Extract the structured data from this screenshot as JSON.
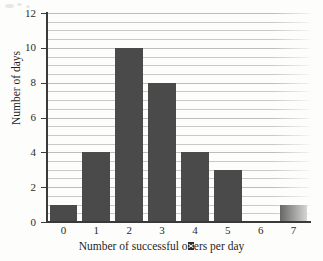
{
  "chart_data": {
    "type": "bar",
    "title": "",
    "xlabel_parts": {
      "before": "Number of successful o",
      "glyph": "ff",
      "after": "ers per day"
    },
    "xlabel": "Number of successful offers per day",
    "ylabel": "Number of days",
    "categories": [
      "0",
      "1",
      "2",
      "3",
      "4",
      "5",
      "6",
      "7"
    ],
    "values": [
      1,
      4,
      10,
      8,
      4,
      3,
      0,
      1
    ],
    "ylim": [
      0,
      12
    ],
    "xlim": [
      -0.5,
      7.5
    ],
    "y_ticks": [
      "0",
      "2",
      "4",
      "6",
      "8",
      "10",
      "12"
    ],
    "y_tick_values": [
      0,
      2,
      4,
      6,
      8,
      10,
      12
    ],
    "y_minor_step": 0.5,
    "grid": "horizontal",
    "legend": "none",
    "colors": {
      "bar_fill": "#4a4a4a",
      "gridline": "#c9c9c9",
      "axis": "#3a3a3a",
      "text": "#2b2b2b",
      "background": "#fdfdfc"
    }
  }
}
